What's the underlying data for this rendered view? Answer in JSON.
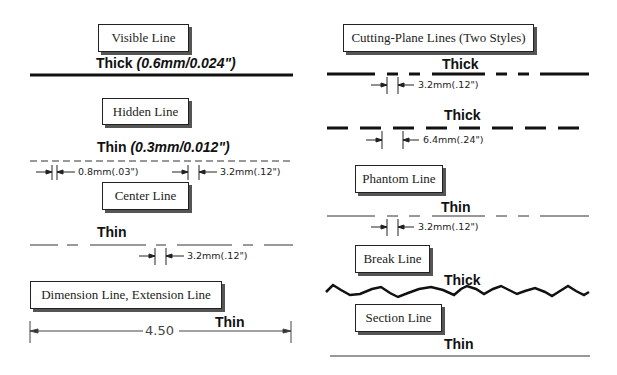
{
  "left_column": {
    "visible_line": {
      "title": "Visible Line",
      "weight": "Thick",
      "spec": "(0.6mm/0.024\")"
    },
    "hidden_line": {
      "title": "Hidden Line",
      "weight": "Thin",
      "spec": "(0.3mm/0.012\")",
      "dim_gap": "0.8mm(.03\")",
      "dim_dash": "3.2mm(.12\")"
    },
    "center_line": {
      "title": "Center Line",
      "weight": "Thin",
      "dim_gap": "3.2mm(.12\")"
    },
    "dimension_line": {
      "title": "Dimension Line, Extension Line",
      "weight": "Thin",
      "value": "4.50"
    }
  },
  "right_column": {
    "cutting_plane": {
      "title": "Cutting-Plane Lines (Two Styles)",
      "style1_weight": "Thick",
      "style1_dim": "3.2mm(.12\")",
      "style2_weight": "Thick",
      "style2_dim": "6.4mm(.24\")"
    },
    "phantom_line": {
      "title": "Phantom Line",
      "weight": "Thin",
      "dim": "3.2mm(.12\")"
    },
    "break_line": {
      "title": "Break Line",
      "weight": "Thick"
    },
    "section_line": {
      "title": "Section Line",
      "weight": "Thin"
    }
  }
}
